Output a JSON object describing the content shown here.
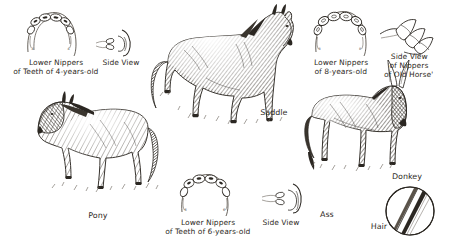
{
  "plate": {
    "title": "Horse types and dental aging plate",
    "background_color": "#ffffff",
    "ink_color": "#2b2722",
    "style": "pen-and-ink engraving with handwritten captions"
  },
  "captions": {
    "nippers_4yr": "Lower Nippers\nof Teeth of 4-years-old",
    "side_view_4yr": "Side View",
    "nippers_8yr": "Lower Nippers\nof 8-years-old",
    "side_view_old": "Side View\nof Nippers\nof Old Horse'",
    "nippers_6yr": "Lower Nippers\nof Teeth of 6-years-old",
    "side_view_6yr": "Side View",
    "saddle": "Saddle",
    "pony": "Pony",
    "donkey": "Donkey",
    "ass": "Ass",
    "hair": "Hair"
  },
  "figures": [
    {
      "name": "lower-nippers-4-years-diagram",
      "kind": "tooth-arch",
      "teeth": 6,
      "age": "4 years"
    },
    {
      "name": "side-view-teeth-4-years-diagram",
      "kind": "tooth-side-view",
      "age": "4 years"
    },
    {
      "name": "saddle-horse-illustration",
      "kind": "animal",
      "species": "horse",
      "facing": "right"
    },
    {
      "name": "lower-nippers-8-years-diagram",
      "kind": "tooth-arch",
      "teeth": 6,
      "age": "8 years"
    },
    {
      "name": "side-view-nippers-old-horse-diagram",
      "kind": "tooth-side-view",
      "age": "old"
    },
    {
      "name": "pony-illustration",
      "kind": "animal",
      "species": "pony",
      "facing": "left"
    },
    {
      "name": "lower-nippers-6-years-diagram",
      "kind": "tooth-arch",
      "teeth": 6,
      "age": "6 years"
    },
    {
      "name": "side-view-teeth-6-years-diagram",
      "kind": "tooth-side-view",
      "age": "6 years"
    },
    {
      "name": "donkey-illustration",
      "kind": "animal",
      "species": "donkey",
      "facing": "right"
    },
    {
      "name": "hair-cross-section-diagram",
      "kind": "circle-cross-section"
    }
  ]
}
